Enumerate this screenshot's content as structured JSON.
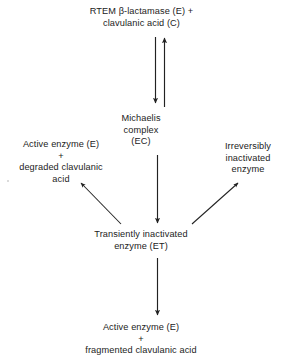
{
  "diagram": {
    "background_color": "#ffffff",
    "line_color": "#222222",
    "text_color": "#222222",
    "nodes": {
      "substrate": {
        "line1": "RTEM  β-lactamase  (E) +",
        "line2": "clavulanic acid  (C)"
      },
      "michaelis": {
        "line1": "Michaelis",
        "line2": "complex",
        "line3": "(EC)"
      },
      "active_degraded": {
        "line1": "Active enzyme  (E)",
        "plus": "+",
        "line2": "degraded clavulanic",
        "line3": "acid"
      },
      "irreversible": {
        "line1": "Irreversibly",
        "line2": "inactivated",
        "line3": "enzyme"
      },
      "transient": {
        "line1": "Transiently inactivated",
        "line2": "enzyme  (ET)"
      },
      "active_fragmented": {
        "line1": "Active enzyme  (E)",
        "plus": "+",
        "line2": "fragmented clavulanic acid"
      }
    },
    "arrows": [
      {
        "name": "substrate-to-michaelis",
        "direction": "down",
        "style": "straight"
      },
      {
        "name": "michaelis-to-substrate",
        "direction": "up",
        "style": "straight"
      },
      {
        "name": "michaelis-to-transient",
        "direction": "down",
        "style": "straight"
      },
      {
        "name": "transient-to-active-degraded",
        "direction": "up-left",
        "style": "diagonal"
      },
      {
        "name": "transient-to-irreversible",
        "direction": "up-right",
        "style": "diagonal"
      },
      {
        "name": "transient-to-active-fragmented",
        "direction": "down",
        "style": "straight"
      }
    ]
  }
}
